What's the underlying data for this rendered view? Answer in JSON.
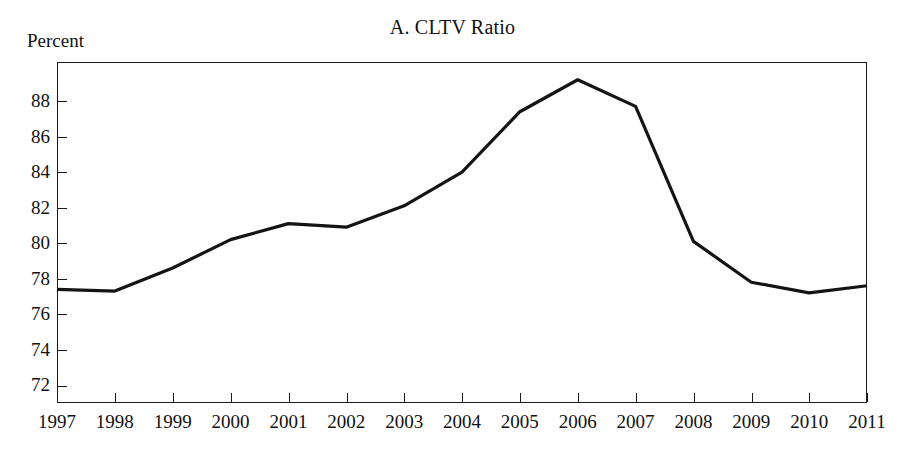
{
  "chart_data": {
    "type": "line",
    "title": "A. CLTV Ratio",
    "xlabel": "",
    "ylabel": "Percent",
    "ylim": [
      71,
      90.2
    ],
    "xlim": [
      1997,
      2011
    ],
    "grid": false,
    "legend": null,
    "y_unit_label": "Percent",
    "categories": [
      "1997",
      "1998",
      "1999",
      "2000",
      "2001",
      "2002",
      "2003",
      "2004",
      "2005",
      "2006",
      "2007",
      "2008",
      "2009",
      "2010",
      "2011"
    ],
    "x": [
      1997,
      1998,
      1999,
      2000,
      2001,
      2002,
      2003,
      2004,
      2005,
      2006,
      2007,
      2008,
      2009,
      2010,
      2011
    ],
    "values": [
      77.4,
      77.3,
      78.6,
      80.2,
      81.1,
      80.9,
      82.1,
      84.0,
      87.4,
      89.2,
      87.7,
      80.1,
      77.8,
      77.2,
      77.6
    ],
    "series": [
      {
        "name": "CLTV Ratio",
        "color": "#141414",
        "values": [
          77.4,
          77.3,
          78.6,
          80.2,
          81.1,
          80.9,
          82.1,
          84.0,
          87.4,
          89.2,
          87.7,
          80.1,
          77.8,
          77.2,
          77.6
        ]
      }
    ],
    "y_ticks": [
      72,
      74,
      76,
      78,
      80,
      82,
      84,
      86,
      88
    ],
    "y_tick_labels": [
      "72",
      "74",
      "76",
      "78",
      "80",
      "82",
      "84",
      "86",
      "88"
    ],
    "x_ticks": [
      1997,
      1998,
      1999,
      2000,
      2001,
      2002,
      2003,
      2004,
      2005,
      2006,
      2007,
      2008,
      2009,
      2010,
      2011
    ],
    "x_tick_labels": [
      "1997",
      "1998",
      "1999",
      "2000",
      "2001",
      "2002",
      "2003",
      "2004",
      "2005",
      "2006",
      "2007",
      "2008",
      "2009",
      "2010",
      "2011"
    ]
  }
}
